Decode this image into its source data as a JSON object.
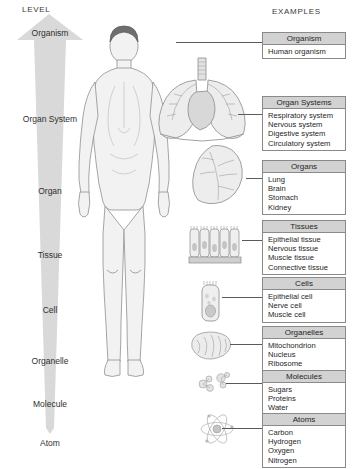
{
  "headers": {
    "level": "LEVEL",
    "examples": "EXAMPLES"
  },
  "levels": [
    {
      "label": "Organism",
      "top": 14
    },
    {
      "label": "Organ System",
      "top": 100
    },
    {
      "label": "Organ",
      "top": 172
    },
    {
      "label": "Tissue",
      "top": 236
    },
    {
      "label": "Cell",
      "top": 291
    },
    {
      "label": "Organelle",
      "top": 342
    },
    {
      "label": "Molecule",
      "top": 385
    },
    {
      "label": "Atom",
      "top": 424
    }
  ],
  "boxes": [
    {
      "title": "Organism",
      "items": [
        "Human organism"
      ],
      "top": 32
    },
    {
      "title": "Organ Systems",
      "items": [
        "Respiratory system",
        "Nervous system",
        "Digestive system",
        "Circulatory system"
      ],
      "top": 96
    },
    {
      "title": "Organs",
      "items": [
        "Lung",
        "Brain",
        "Stomach",
        "Kidney"
      ],
      "top": 160
    },
    {
      "title": "Tissues",
      "items": [
        "Epithelial tissue",
        "Nervous tissue",
        "Muscle tissue",
        "Connective tissue"
      ],
      "top": 220
    },
    {
      "title": "Cells",
      "items": [
        "Epithelial cell",
        "Nerve cell",
        "Muscle cell"
      ],
      "top": 277
    },
    {
      "title": "Organelles",
      "items": [
        "Mitochondrion",
        "Nucleus",
        "Ribosome"
      ],
      "top": 326
    },
    {
      "title": "Molecules",
      "items": [
        "Sugars",
        "Proteins",
        "Water"
      ],
      "top": 370
    },
    {
      "title": "Atoms",
      "items": [
        "Carbon",
        "Hydrogen",
        "Oxygen",
        "Nitrogen"
      ],
      "top": 413
    }
  ],
  "illustrations": [
    {
      "name": "human-body-figure",
      "caption": "Human organism"
    },
    {
      "name": "respiratory-system-illustration",
      "caption": "Respiratory system with heart"
    },
    {
      "name": "lung-organ-illustration",
      "caption": "Lung"
    },
    {
      "name": "epithelial-tissue-illustration",
      "caption": "Epithelial tissue"
    },
    {
      "name": "epithelial-cell-illustration",
      "caption": "Epithelial cell"
    },
    {
      "name": "mitochondrion-illustration",
      "caption": "Mitochondrion"
    },
    {
      "name": "molecules-illustration",
      "caption": "Molecules"
    },
    {
      "name": "atom-illustration",
      "caption": "Atom"
    }
  ],
  "colors": {
    "arrow_fill": "#d9d9d9",
    "box_header": "#d2d2d2",
    "box_border": "#8a8a8a",
    "leader_line": "#5a5a5a",
    "text": "#262626",
    "art_line": "#7a7a7a",
    "art_fill": "#ededed"
  }
}
